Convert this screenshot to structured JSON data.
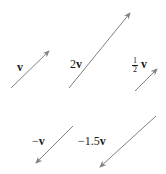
{
  "diagram": {
    "stroke_color": "#808080",
    "label_color": "#1a1a1a",
    "vectors": [
      {
        "id": "v",
        "label_coef": "",
        "label_var": "v",
        "x1": 11,
        "y1": 88,
        "x2": 49,
        "y2": 51,
        "label_x": 17,
        "label_y": 61
      },
      {
        "id": "2v",
        "label_coef": "2",
        "label_var": "v",
        "x1": 69,
        "y1": 88,
        "x2": 130,
        "y2": 13,
        "label_x": 70,
        "label_y": 58
      },
      {
        "id": "half-v",
        "label_coef_num": "1",
        "label_coef_den": "2",
        "label_var": "v",
        "x1": 135,
        "y1": 91,
        "x2": 157,
        "y2": 69,
        "label_x": 132,
        "label_y": 57
      },
      {
        "id": "neg-v",
        "label_coef": "−",
        "label_var": "v",
        "x1": 73,
        "y1": 126,
        "x2": 36,
        "y2": 163,
        "label_x": 32,
        "label_y": 135
      },
      {
        "id": "neg-1.5v",
        "label_coef": "−1.5",
        "label_var": "v",
        "x1": 156,
        "y1": 116,
        "x2": 100,
        "y2": 167,
        "label_x": 78,
        "label_y": 135
      }
    ]
  }
}
